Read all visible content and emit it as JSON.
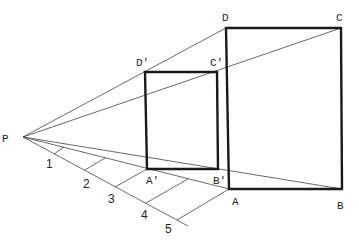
{
  "diagram": {
    "type": "perspective-projection",
    "colors": {
      "line": "#444444",
      "rect": "#1a1a1a",
      "text": "#222222",
      "background": "#ffffff"
    },
    "center": {
      "label": "P",
      "x": 23,
      "y": 137
    },
    "large_rect": {
      "A": {
        "label": "A",
        "x": 229,
        "y": 189
      },
      "B": {
        "label": "B",
        "x": 342,
        "y": 189
      },
      "C": {
        "label": "C",
        "x": 341,
        "y": 28
      },
      "D": {
        "label": "D",
        "x": 226,
        "y": 28
      }
    },
    "small_rect": {
      "A": {
        "label": "A'",
        "x": 147,
        "y": 169
      },
      "B": {
        "label": "B'",
        "x": 218,
        "y": 169
      },
      "C": {
        "label": "C'",
        "x": 217,
        "y": 72
      },
      "D": {
        "label": "D'",
        "x": 145,
        "y": 72
      }
    },
    "scale_ticks": [
      "1",
      "2",
      "3",
      "4",
      "5"
    ]
  }
}
